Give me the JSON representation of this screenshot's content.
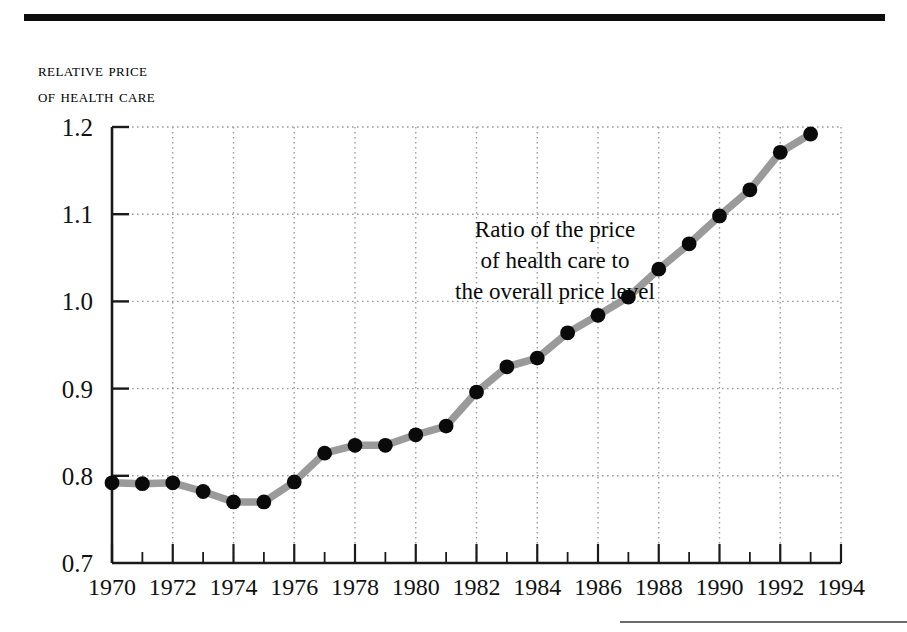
{
  "figure": {
    "y_axis_title_line1": "Relative price",
    "y_axis_title_line2": "of health care",
    "annotation_line1": "Ratio of the price",
    "annotation_line2": "of health care to",
    "annotation_line3": "the overall price level",
    "line_color": "#9a9a9a",
    "marker_color": "#0a0a0a",
    "grid_color": "#9c9c9c",
    "axis_color": "#1a1a1a",
    "rule_color": "#0d0d0d"
  },
  "chart_data": {
    "type": "line",
    "title": "",
    "subtitle": "",
    "xlabel": "",
    "ylabel": "Relative price of health care",
    "annotation": "Ratio of the price of health care to the overall price level",
    "xlim": [
      1970,
      1994
    ],
    "ylim": [
      0.7,
      1.2
    ],
    "ytick_labels": [
      "0.7",
      "0.8",
      "0.9",
      "1.0",
      "1.1",
      "1.2"
    ],
    "yticks": [
      0.7,
      0.8,
      0.9,
      1.0,
      1.1,
      1.2
    ],
    "xtick_labels": [
      "1970",
      "1972",
      "1974",
      "1976",
      "1978",
      "1980",
      "1982",
      "1984",
      "1986",
      "1988",
      "1990",
      "1992",
      "1994"
    ],
    "xticks": [
      1970,
      1972,
      1974,
      1976,
      1978,
      1980,
      1982,
      1984,
      1986,
      1988,
      1990,
      1992,
      1994
    ],
    "x_minor_ticks": [
      1971,
      1973,
      1975,
      1977,
      1979,
      1981,
      1983,
      1985,
      1987,
      1989,
      1991,
      1993
    ],
    "grid": "dotted",
    "legend": "none",
    "markers": "filled-circle",
    "x": [
      1970,
      1971,
      1972,
      1973,
      1974,
      1975,
      1976,
      1977,
      1978,
      1979,
      1980,
      1981,
      1982,
      1983,
      1984,
      1985,
      1986,
      1987,
      1988,
      1989,
      1990,
      1991,
      1992,
      1993
    ],
    "values": [
      0.792,
      0.791,
      0.792,
      0.782,
      0.77,
      0.77,
      0.793,
      0.826,
      0.835,
      0.835,
      0.847,
      0.857,
      0.896,
      0.925,
      0.935,
      0.964,
      0.984,
      1.005,
      1.037,
      1.066,
      1.098,
      1.128,
      1.171,
      1.192
    ],
    "series": [
      {
        "name": "Relative price of health care",
        "values": [
          0.792,
          0.791,
          0.792,
          0.782,
          0.77,
          0.77,
          0.793,
          0.826,
          0.835,
          0.835,
          0.847,
          0.857,
          0.896,
          0.925,
          0.935,
          0.964,
          0.984,
          1.005,
          1.037,
          1.066,
          1.098,
          1.128,
          1.171,
          1.192
        ]
      }
    ]
  }
}
